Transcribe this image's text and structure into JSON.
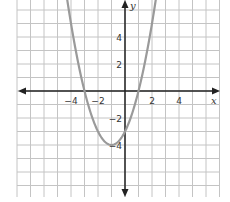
{
  "chart_data": {
    "type": "line",
    "title": "",
    "xlabel": "x",
    "ylabel": "y",
    "equation": "y = x^2 + 2x - 3",
    "xlim": [
      -8,
      7
    ],
    "ylim": [
      -8,
      7
    ],
    "grid": true,
    "x_ticks": [
      {
        "value": -4,
        "label": "−4"
      },
      {
        "value": -2,
        "label": "−2"
      },
      {
        "value": 2,
        "label": "2"
      },
      {
        "value": 4,
        "label": "4"
      }
    ],
    "y_ticks": [
      {
        "value": 4,
        "label": "4"
      },
      {
        "value": 2,
        "label": "2"
      },
      {
        "value": -2,
        "label": "−2"
      },
      {
        "value": -4,
        "label": "−4"
      }
    ],
    "key_points": [
      {
        "name": "x-intercept",
        "x": -3,
        "y": 0
      },
      {
        "name": "x-intercept",
        "x": 1,
        "y": 0
      },
      {
        "name": "vertex",
        "x": -1,
        "y": -4
      },
      {
        "name": "y-intercept",
        "x": 0,
        "y": -3
      }
    ],
    "series": [
      {
        "name": "parabola",
        "x": [
          -5.2,
          -5,
          -4,
          -3,
          -2,
          -1,
          0,
          1,
          2,
          3.2
        ],
        "y": [
          13.64,
          12,
          5,
          0,
          -3,
          -4,
          -3,
          0,
          5,
          13.64
        ]
      }
    ],
    "colors": {
      "curve": "#9a9a9a",
      "axis": "#222222",
      "grid": "#c4c4c4"
    }
  }
}
